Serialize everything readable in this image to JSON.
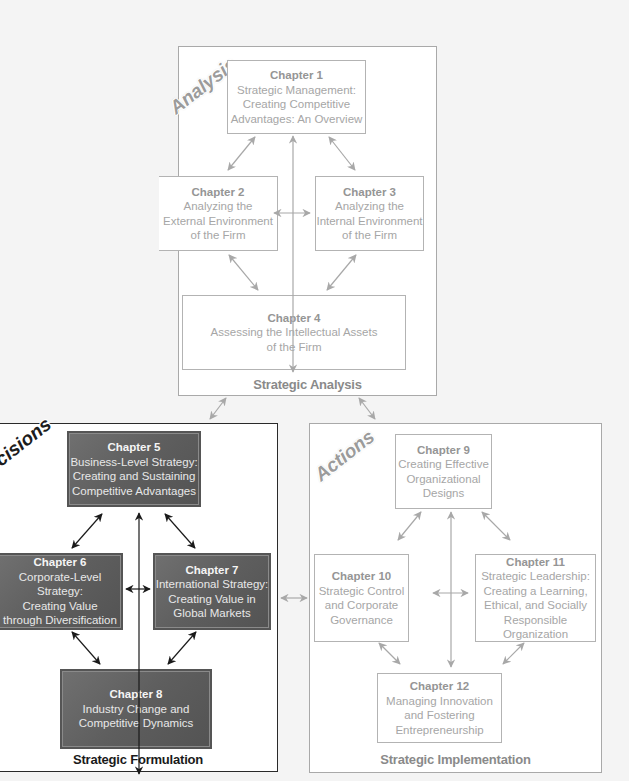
{
  "diagram": {
    "panels": {
      "analysis": {
        "stage_label": "Analysis",
        "footer": "Strategic Analysis",
        "chapters": [
          {
            "chapter": "Chapter 1",
            "lines": [
              "Strategic Management:",
              "Creating Competitive",
              "Advantages: An Overview"
            ]
          },
          {
            "chapter": "Chapter 2",
            "lines": [
              "Analyzing the",
              "External Environment",
              "of the Firm"
            ]
          },
          {
            "chapter": "Chapter 3",
            "lines": [
              "Analyzing the",
              "Internal Environment",
              "of the Firm"
            ]
          },
          {
            "chapter": "Chapter 4",
            "lines": [
              "Assessing the Intellectual Assets",
              "of the Firm"
            ]
          }
        ]
      },
      "decisions": {
        "stage_label": "Decisions",
        "footer": "Strategic Formulation",
        "chapters": [
          {
            "chapter": "Chapter 5",
            "lines": [
              "Business-Level Strategy:",
              "Creating and Sustaining",
              "Competitive Advantages"
            ]
          },
          {
            "chapter": "Chapter 6",
            "lines": [
              "Corporate-Level Strategy:",
              "Creating Value",
              "through Diversification"
            ]
          },
          {
            "chapter": "Chapter 7",
            "lines": [
              "International Strategy:",
              "Creating Value in",
              "Global Markets"
            ]
          },
          {
            "chapter": "Chapter 8",
            "lines": [
              "Industry Change and",
              "Competitive Dynamics"
            ]
          }
        ]
      },
      "actions": {
        "stage_label": "Actions",
        "footer": "Strategic Implementation",
        "chapters": [
          {
            "chapter": "Chapter 9",
            "lines": [
              "Creating Effective",
              "Organizational",
              "Designs"
            ]
          },
          {
            "chapter": "Chapter 10",
            "lines": [
              "Strategic Control",
              "and Corporate",
              "Governance"
            ]
          },
          {
            "chapter": "Chapter 11",
            "lines": [
              "Strategic Leadership:",
              "Creating a Learning,",
              "Ethical, and Socially",
              "Responsible",
              "Organization"
            ]
          },
          {
            "chapter": "Chapter 12",
            "lines": [
              "Managing Innovation",
              "and Fostering",
              "Entrepreneurship"
            ]
          }
        ]
      }
    },
    "colors": {
      "light_border": "#a9a9a9",
      "light_text": "#a6a6a6",
      "dark_box_fill": "#626262",
      "dark_border": "#2a2a2a",
      "light_arrow": "#a8a8a8",
      "dark_arrow": "#1a1a1a"
    }
  }
}
